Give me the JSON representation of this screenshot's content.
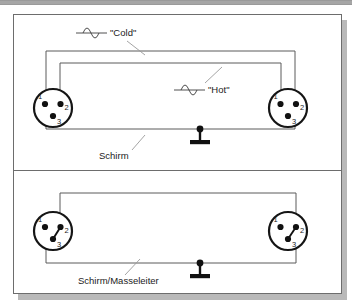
{
  "figure": {
    "stroke_color": "#3c3c3c",
    "wire_color": "#5a5a5a",
    "text_color": "#1b1b1b",
    "frame_color": "#6d6d6d",
    "shadow_color": "#b9b9b9",
    "background": "#ffffff"
  },
  "panels": [
    {
      "id": "balanced-cable",
      "name": "Symmetrisches Kabel",
      "labels": {
        "cold": "\"Cold\"",
        "hot": "\"Hot\"",
        "shield": "Schirm"
      },
      "icons": {
        "cold_symbol": "sine-wave-icon",
        "hot_symbol": "sine-wave-icon",
        "ground_symbol": "ground-icon"
      },
      "connectors": [
        {
          "side": "left",
          "name": "xlr-connector-left",
          "pins": [
            "1",
            "2",
            "3"
          ],
          "jumper": false
        },
        {
          "side": "right",
          "name": "xlr-connector-right",
          "pins": [
            "1",
            "2",
            "3"
          ],
          "jumper": false
        }
      ],
      "wires": [
        {
          "name": "cold-wire",
          "from_pin": "1",
          "to_pin": "1"
        },
        {
          "name": "hot-wire",
          "from_pin": "2",
          "to_pin": "2"
        },
        {
          "name": "shield-wire",
          "from_pin": "3",
          "to_pin": "3"
        }
      ]
    },
    {
      "id": "unbalanced-cable",
      "name": "Unsymmetrisches Kabel",
      "labels": {
        "shield": "Schirm/Masseleiter"
      },
      "icons": {
        "ground_symbol": "ground-icon"
      },
      "connectors": [
        {
          "side": "left",
          "name": "xlr-connector-left",
          "pins": [
            "1",
            "2",
            "3"
          ],
          "jumper": true
        },
        {
          "side": "right",
          "name": "xlr-connector-right",
          "pins": [
            "1",
            "2",
            "3"
          ],
          "jumper": true
        }
      ],
      "wires": [
        {
          "name": "signal-wire",
          "from_pin": "2",
          "to_pin": "2"
        },
        {
          "name": "shield-ground-wire",
          "from_pin": "1",
          "to_pin": "1"
        }
      ]
    }
  ]
}
